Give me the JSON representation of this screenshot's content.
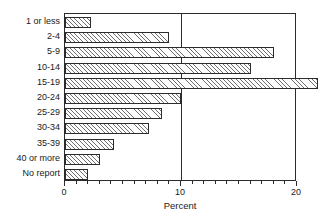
{
  "chart_data": {
    "type": "bar",
    "orientation": "horizontal",
    "title": "",
    "xlabel": "Percent",
    "ylabel": "",
    "categories": [
      "1 or less",
      "2-4",
      "5-9",
      "10-14",
      "15-19",
      "20-24",
      "25-29",
      "30-34",
      "35-39",
      "40 or more",
      "No report"
    ],
    "values": [
      2.2,
      9.0,
      18.0,
      16.0,
      21.8,
      10.0,
      8.4,
      7.2,
      4.2,
      3.0,
      2.0
    ],
    "xlim": [
      0,
      20
    ],
    "xticks": [
      0,
      10,
      20
    ],
    "xtick_labels": [
      "0",
      "10",
      "20"
    ],
    "minor_tick_step": 1,
    "grid": "single vertical rule at 10",
    "legend": "none",
    "bar_style": "diagonal hatch with dark outline",
    "colors": {
      "axis": "#2b2b2b",
      "bar_outline": "#2b2b2b",
      "bar_hatch": "#6f6f6f",
      "bar_fill": "#fdfdfd",
      "text": "#1a1a1a",
      "background": "#ffffff"
    }
  }
}
